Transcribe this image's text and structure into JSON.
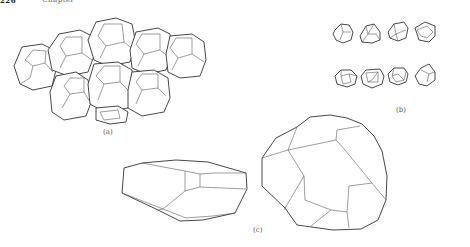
{
  "page": {
    "number": "226",
    "running_head": "Chapter"
  },
  "figure": {
    "panels": [
      {
        "id": "a",
        "label": "(a)",
        "description": "cluster of packed truncated-octahedron-like cells (foam)"
      },
      {
        "id": "b",
        "label": "(b)",
        "description": "eight individual irregular polyhedral cells in two rows of four"
      },
      {
        "id": "c",
        "label": "(c)",
        "description": "two enlarged polyhedral cells: flattened and rounded"
      }
    ]
  }
}
